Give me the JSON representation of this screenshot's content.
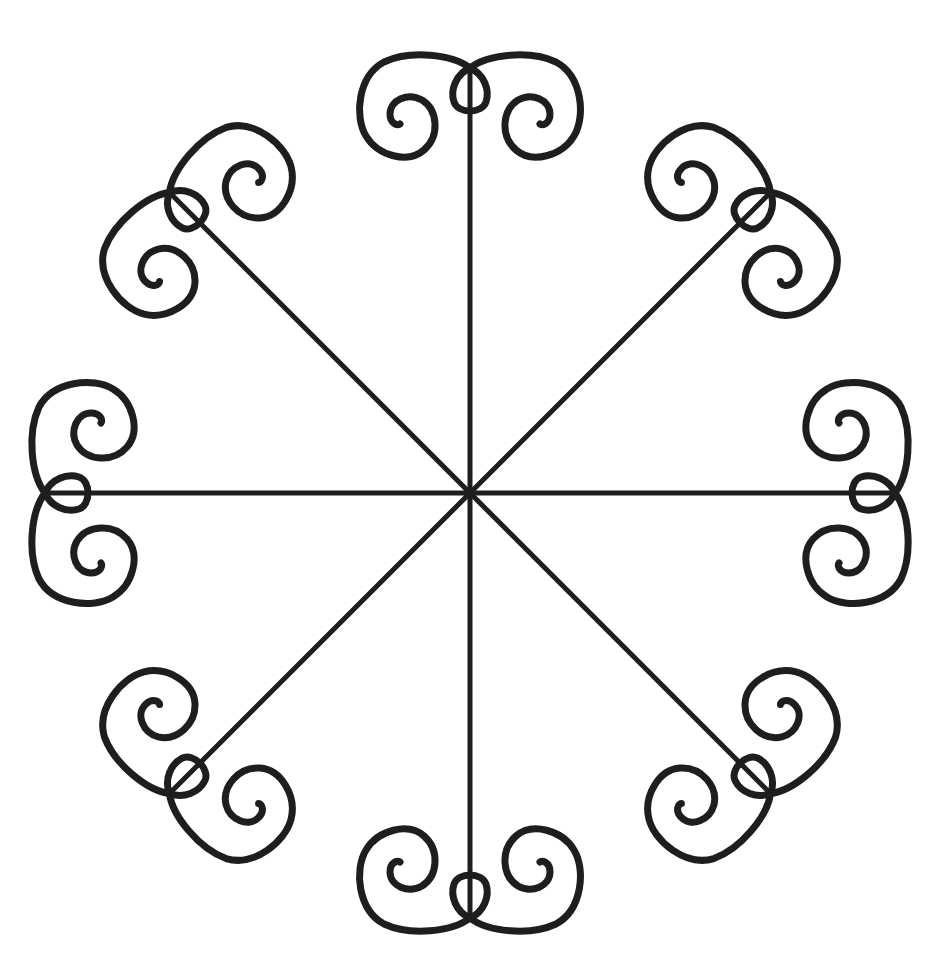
{
  "figure": {
    "type": "radial-ornament",
    "width": 942,
    "height": 975,
    "background": "#ffffff",
    "stroke_color": "#1e1e1e",
    "stroke_width": 7,
    "spoke_width": 5,
    "center": {
      "x": 470,
      "y": 493
    },
    "spoke_length": 425,
    "arm_count": 8,
    "arms": [
      {
        "id": "n",
        "label": "north arm",
        "angle": 0
      },
      {
        "id": "ne",
        "label": "north-east arm",
        "angle": 45
      },
      {
        "id": "e",
        "label": "east arm",
        "angle": 90
      },
      {
        "id": "se",
        "label": "south-east arm",
        "angle": 135
      },
      {
        "id": "s",
        "label": "south arm",
        "angle": 180
      },
      {
        "id": "sw",
        "label": "south-west arm",
        "angle": 225
      },
      {
        "id": "w",
        "label": "west arm",
        "angle": 270
      },
      {
        "id": "nw",
        "label": "north-west arm",
        "angle": 315
      }
    ],
    "arm_parts": {
      "spoke": "straight line from center to tip",
      "loop": "teardrop loop at tip",
      "spirals": [
        "left spiral",
        "right spiral"
      ]
    }
  }
}
